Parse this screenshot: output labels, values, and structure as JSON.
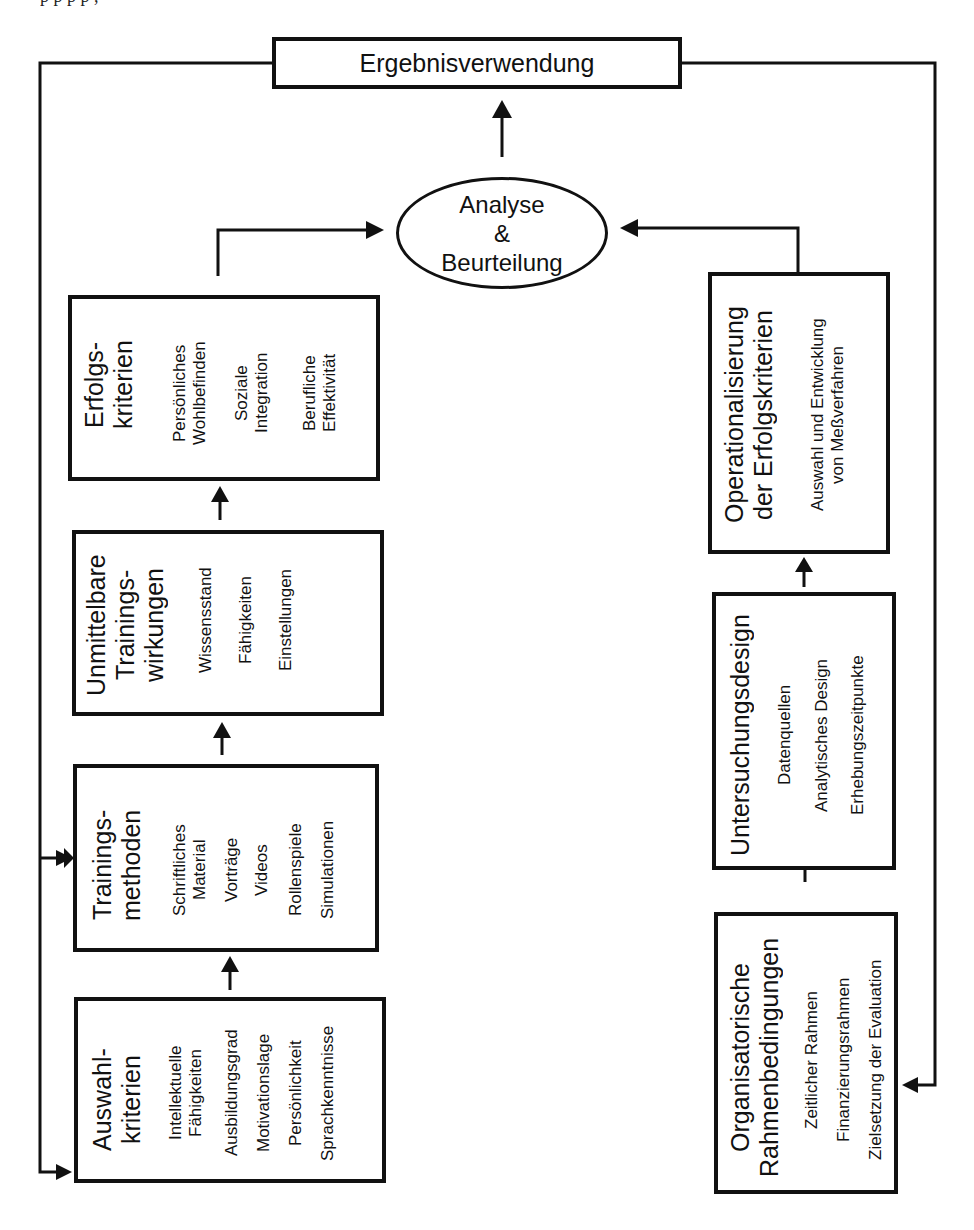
{
  "header_fragment": "p      p                p                    p                                               ,",
  "result_box": {
    "label": "Ergebnisverwendung"
  },
  "analysis": {
    "line1": "Analyse",
    "line2": "&",
    "line3": "Beurteilung"
  },
  "left_column": [
    {
      "id": "auswahl",
      "title_lines": [
        "Auswahl-",
        "kriterien"
      ],
      "items": [
        [
          "Intellektuelle",
          "Fähigkeiten"
        ],
        [
          "Ausbildungsgrad"
        ],
        [
          "Motivationslage"
        ],
        [
          "Persönlichkeit"
        ],
        [
          "Sprachkenntnisse"
        ]
      ]
    },
    {
      "id": "trainingsmethoden",
      "title_lines": [
        "Trainings-",
        "methoden"
      ],
      "items": [
        [
          "Schriftliches",
          "Material"
        ],
        [
          "Vorträge"
        ],
        [
          "Videos"
        ],
        [
          "Rollenspiele"
        ],
        [
          "Simulationen"
        ]
      ]
    },
    {
      "id": "wirkungen",
      "title_lines": [
        "Unmittelbare",
        "Trainings-",
        "wirkungen"
      ],
      "items": [
        [
          "Wissensstand"
        ],
        [
          "Fähigkeiten"
        ],
        [
          "Einstellungen"
        ]
      ]
    },
    {
      "id": "erfolgskriterien",
      "title_lines": [
        "Erfolgs-",
        "kriterien"
      ],
      "items": [
        [
          "Persönliches",
          "Wohlbefinden"
        ],
        [
          "Soziale",
          "Integration"
        ],
        [
          "Berufliche",
          "Effektivität"
        ]
      ]
    }
  ],
  "right_column": [
    {
      "id": "rahmen",
      "title_lines": [
        "Organisatorische",
        "Rahmenbedingungen"
      ],
      "items": [
        [
          "Zeitlicher Rahmen"
        ],
        [
          "Finanzierungsrahmen"
        ],
        [
          "Zielsetzung der Evaluation"
        ]
      ]
    },
    {
      "id": "design",
      "title_lines": [
        "Untersuchungsdesign"
      ],
      "items": [
        [
          "Datenquellen"
        ],
        [
          "Analytisches Design"
        ],
        [
          "Erhebungszeitpunkte"
        ]
      ]
    },
    {
      "id": "operationalisierung",
      "title_lines": [
        "Operationalisierung",
        "der Erfolgskriterien"
      ],
      "items": [
        [
          "Auswahl und Entwicklung",
          "von Meßverfahren"
        ]
      ]
    }
  ],
  "colors": {
    "line": "#111111",
    "background": "#ffffff"
  }
}
